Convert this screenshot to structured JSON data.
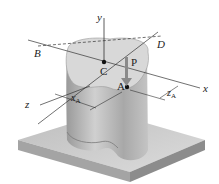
{
  "figure": {
    "type": "3D mechanics diagram — eccentric load on column",
    "labels": {
      "y_axis": "y",
      "x_axis": "x",
      "z_axis": "z",
      "point_B": "B",
      "point_D": "D",
      "point_C": "C",
      "point_A": "A",
      "load": "P",
      "dim_x": "x",
      "dim_x_sub": "A",
      "dim_z": "z",
      "dim_z_sub": "A"
    },
    "colors": {
      "base_top": "#c9c9c9",
      "base_side": "#9c9c9c",
      "column_body": "#b8b8b8",
      "column_top": "#d9d9d9",
      "axis_line": "#333333",
      "load_arrow": "#8a8a8a"
    }
  }
}
